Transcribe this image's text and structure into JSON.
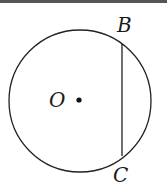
{
  "figure": {
    "type": "circle-with-chord",
    "circle": {
      "center_label": "O",
      "cx": 80,
      "cy": 101,
      "r": 71
    },
    "chord": {
      "from_label": "B",
      "to_label": "C",
      "x1": 122,
      "y1": 44,
      "x2": 122,
      "y2": 156
    },
    "labels": {
      "B": "B",
      "O": "O",
      "C": "C"
    },
    "stroke_color": "#222222"
  }
}
